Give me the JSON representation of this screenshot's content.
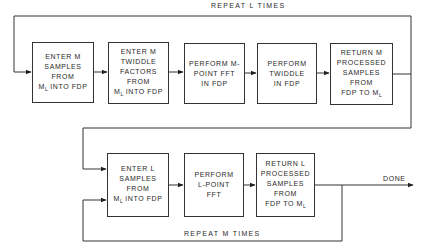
{
  "diagram": {
    "colors": {
      "line": "#333333",
      "text": "#2a2a2a",
      "background": "#ffffff"
    },
    "outer_loop": {
      "label": "REPEAT L TIMES"
    },
    "inner_loop": {
      "label": "REPEAT M TIMES"
    },
    "output": {
      "label": "DONE"
    },
    "top_row": [
      {
        "id": "enter-m-samples",
        "lines": [
          "ENTER M",
          "SAMPLES",
          "FROM"
        ],
        "last": {
          "pre": "M",
          "sub": "L",
          "post": " INTO FDP"
        }
      },
      {
        "id": "enter-m-twiddle",
        "lines": [
          "ENTER M",
          "TWIDDLE",
          "FACTORS",
          "FROM"
        ],
        "last": {
          "pre": "M",
          "sub": "L",
          "post": " INTO FDP"
        }
      },
      {
        "id": "m-point-fft",
        "lines": [
          "PERFORM M-",
          "POINT FFT",
          "IN FDP"
        ]
      },
      {
        "id": "twiddle",
        "lines": [
          "PERFORM",
          "TWIDDLE",
          "IN FDP"
        ]
      },
      {
        "id": "return-m",
        "lines": [
          "RETURN M",
          "PROCESSED",
          "SAMPLES",
          "FROM"
        ],
        "last": {
          "pre": "FDP TO M",
          "sub": "L",
          "post": ""
        }
      }
    ],
    "bottom_row": [
      {
        "id": "enter-l-samples",
        "lines": [
          "ENTER L",
          "SAMPLES",
          "FROM"
        ],
        "last": {
          "pre": "M",
          "sub": "L",
          "post": " INTO FDP"
        }
      },
      {
        "id": "l-point-fft",
        "lines": [
          "PERFORM",
          "L-POINT",
          "FFT"
        ]
      },
      {
        "id": "return-l",
        "lines": [
          "RETURN L",
          "PROCESSED",
          "SAMPLES",
          "FROM"
        ],
        "last": {
          "pre": "FDP TO M",
          "sub": "L",
          "post": ""
        }
      }
    ]
  }
}
